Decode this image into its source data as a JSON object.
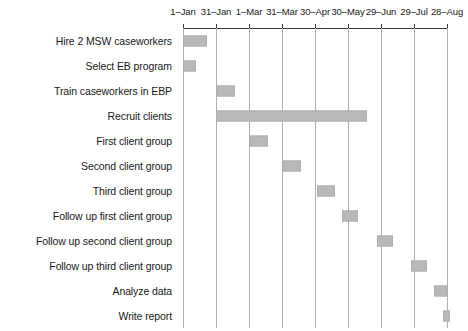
{
  "chart_data": {
    "type": "bar",
    "subtype": "gantt",
    "title": "",
    "xlabel": "",
    "ylabel": "",
    "grid": true,
    "legend": null,
    "orientation": "horizontal",
    "axis": {
      "position": "top",
      "tick_labels": [
        "1–Jan",
        "31–Jan",
        "1–Mar",
        "31–Mar",
        "30–Apr",
        "30–May",
        "29–Jun",
        "29–Jul",
        "28–Aug"
      ],
      "tick_values": [
        0,
        1,
        2,
        3,
        4,
        5,
        6,
        7,
        8
      ],
      "xlim": [
        0,
        8
      ]
    },
    "bar_color": "#b9b9b9",
    "bar_edge_color": "#aeaeae",
    "categories": [
      "Hire 2 MSW caseworkers",
      "Select EB program",
      "Train caseworkers in EBP",
      "Recruit clients",
      "First client group",
      "Second client group",
      "Third client group",
      "Follow up first client group",
      "Follow up second client group",
      "Follow up third client group",
      "Analyze data",
      "Write report"
    ],
    "tasks": [
      {
        "label": "Hire 2 MSW caseworkers",
        "start": 0.0,
        "end": 0.73,
        "start_date": "1–Jan",
        "end_date": "24–Jan"
      },
      {
        "label": "Select EB program",
        "start": 0.0,
        "end": 0.39,
        "start_date": "1–Jan",
        "end_date": "12–Jan"
      },
      {
        "label": "Train caseworkers in EBP",
        "start": 1.04,
        "end": 1.59,
        "start_date": "3–Feb",
        "end_date": "20–Feb"
      },
      {
        "label": "Recruit clients",
        "start": 1.0,
        "end": 5.57,
        "start_date": "31–Jan",
        "end_date": "17–Jun"
      },
      {
        "label": "First client group",
        "start": 2.03,
        "end": 2.58,
        "start_date": "5–Mar",
        "end_date": "22–Mar"
      },
      {
        "label": "Second client group",
        "start": 3.04,
        "end": 3.59,
        "start_date": "4–Apr",
        "end_date": "21–Apr"
      },
      {
        "label": "Third client group",
        "start": 4.05,
        "end": 4.6,
        "start_date": "4–May",
        "end_date": "21–May"
      },
      {
        "label": "Follow up first client group",
        "start": 4.83,
        "end": 5.3,
        "start_date": "27–May",
        "end_date": "11–Jun"
      },
      {
        "label": "Follow up second client group",
        "start": 5.88,
        "end": 6.35,
        "start_date": "26–Jun",
        "end_date": "11–Jul"
      },
      {
        "label": "Follow up third client group",
        "start": 6.92,
        "end": 7.39,
        "start_date": "27–Jul",
        "end_date": "11–Aug"
      },
      {
        "label": "Analyze data",
        "start": 7.6,
        "end": 8.0,
        "start_date": "18–Aug",
        "end_date": "28–Aug"
      },
      {
        "label": "Write report",
        "start": 7.88,
        "end": 8.1,
        "start_date": "26–Aug",
        "end_date": "3–Sep"
      }
    ]
  }
}
